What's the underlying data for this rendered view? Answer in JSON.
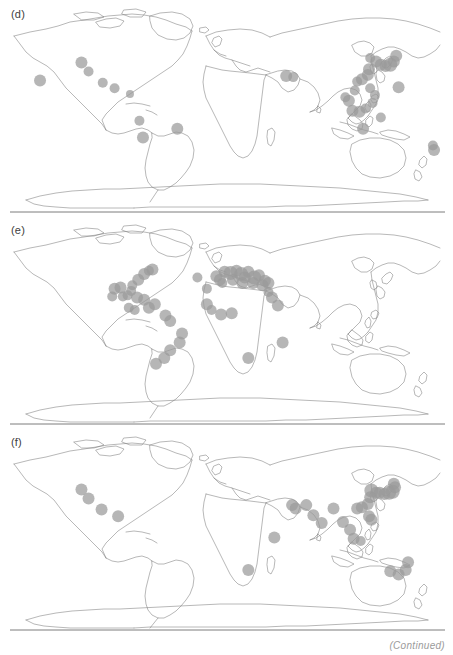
{
  "figure": {
    "caption": "(Continued)",
    "projection": "equirectangular",
    "marker_color": "#9a9a9a",
    "marker_opacity": 0.72,
    "coastline_color": "#7d7d7d",
    "background": "#ffffff",
    "lon_range": [
      -180,
      180
    ],
    "lat_range": [
      -90,
      90
    ]
  },
  "panels": [
    {
      "id": "panel-d",
      "label": "(d)",
      "region_summary": "Indo-West Pacific and eastern Pacific",
      "chart_data": {
        "type": "scatter",
        "title": "(d)",
        "xlabel": "Longitude",
        "ylabel": "Latitude",
        "xlim": [
          -180,
          180
        ],
        "ylim": [
          -90,
          90
        ],
        "grid": false,
        "legend": null,
        "series": [
          {
            "name": "occurrence records",
            "marker": "filled-circle",
            "color": "#9a9a9a",
            "points": [
              {
                "lon": -123,
                "lat": 37,
                "r": 6
              },
              {
                "lon": -117,
                "lat": 29,
                "r": 5
              },
              {
                "lon": -105,
                "lat": 19,
                "r": 5
              },
              {
                "lon": -95,
                "lat": 14,
                "r": 5
              },
              {
                "lon": -82,
                "lat": 9,
                "r": 4
              },
              {
                "lon": -74,
                "lat": -15,
                "r": 5
              },
              {
                "lon": -71,
                "lat": -30,
                "r": 6
              },
              {
                "lon": -42,
                "lat": -22,
                "r": 6
              },
              {
                "lon": -158,
                "lat": 21,
                "r": 6
              },
              {
                "lon": 50,
                "lat": 25,
                "r": 6
              },
              {
                "lon": 56,
                "lat": 24,
                "r": 5
              },
              {
                "lon": 121,
                "lat": 41,
                "r": 5
              },
              {
                "lon": 126,
                "lat": 38,
                "r": 6
              },
              {
                "lon": 130,
                "lat": 35,
                "r": 6
              },
              {
                "lon": 134,
                "lat": 34,
                "r": 6
              },
              {
                "lon": 138,
                "lat": 35,
                "r": 7
              },
              {
                "lon": 141,
                "lat": 38,
                "r": 6
              },
              {
                "lon": 143,
                "lat": 43,
                "r": 6
              },
              {
                "lon": 120,
                "lat": 31,
                "r": 6
              },
              {
                "lon": 119,
                "lat": 26,
                "r": 6
              },
              {
                "lon": 114,
                "lat": 22,
                "r": 6
              },
              {
                "lon": 110,
                "lat": 20,
                "r": 5
              },
              {
                "lon": 108,
                "lat": 12,
                "r": 5
              },
              {
                "lon": 103,
                "lat": 3,
                "r": 6
              },
              {
                "lon": 100,
                "lat": 6,
                "r": 5
              },
              {
                "lon": 106,
                "lat": -6,
                "r": 6
              },
              {
                "lon": 112,
                "lat": -7,
                "r": 6
              },
              {
                "lon": 117,
                "lat": -4,
                "r": 5
              },
              {
                "lon": 123,
                "lat": 1,
                "r": 5
              },
              {
                "lon": 121,
                "lat": 14,
                "r": 5
              },
              {
                "lon": 125,
                "lat": 8,
                "r": 5
              },
              {
                "lon": 145,
                "lat": 15,
                "r": 6
              },
              {
                "lon": 130,
                "lat": -12,
                "r": 5
              },
              {
                "lon": 115,
                "lat": -22,
                "r": 6
              },
              {
                "lon": 174,
                "lat": -37,
                "r": 5
              },
              {
                "lon": 175,
                "lat": -41,
                "r": 6
              }
            ]
          }
        ]
      }
    },
    {
      "id": "panel-e",
      "label": "(e)",
      "region_summary": "Atlantic Ocean, Mediterranean Sea and Caribbean",
      "chart_data": {
        "type": "scatter",
        "title": "(e)",
        "xlabel": "Longitude",
        "ylabel": "Latitude",
        "xlim": [
          -180,
          180
        ],
        "ylim": [
          -90,
          90
        ],
        "grid": false,
        "legend": null,
        "series": [
          {
            "name": "occurrence records",
            "marker": "filled-circle",
            "color": "#9a9a9a",
            "points": [
              {
                "lon": -63,
                "lat": 45,
                "r": 6
              },
              {
                "lon": -66,
                "lat": 44,
                "r": 5
              },
              {
                "lon": -70,
                "lat": 41,
                "r": 6
              },
              {
                "lon": -75,
                "lat": 36,
                "r": 6
              },
              {
                "lon": -80,
                "lat": 31,
                "r": 5
              },
              {
                "lon": -81,
                "lat": 26,
                "r": 5
              },
              {
                "lon": -90,
                "lat": 29,
                "r": 6
              },
              {
                "lon": -95,
                "lat": 28,
                "r": 6
              },
              {
                "lon": -97,
                "lat": 21,
                "r": 5
              },
              {
                "lon": -88,
                "lat": 21,
                "r": 5
              },
              {
                "lon": -84,
                "lat": 22,
                "r": 5
              },
              {
                "lon": -76,
                "lat": 20,
                "r": 6
              },
              {
                "lon": -70,
                "lat": 18,
                "r": 6
              },
              {
                "lon": -66,
                "lat": 11,
                "r": 6
              },
              {
                "lon": -61,
                "lat": 14,
                "r": 6
              },
              {
                "lon": -78,
                "lat": 9,
                "r": 5
              },
              {
                "lon": -83,
                "lat": 11,
                "r": 5
              },
              {
                "lon": -52,
                "lat": 4,
                "r": 6
              },
              {
                "lon": -48,
                "lat": -1,
                "r": 6
              },
              {
                "lon": -38,
                "lat": -12,
                "r": 6
              },
              {
                "lon": -40,
                "lat": -20,
                "r": 6
              },
              {
                "lon": -48,
                "lat": -27,
                "r": 6
              },
              {
                "lon": -53,
                "lat": -34,
                "r": 6
              },
              {
                "lon": -60,
                "lat": -39,
                "r": 6
              },
              {
                "lon": -25,
                "lat": 38,
                "r": 5
              },
              {
                "lon": -17,
                "lat": 28,
                "r": 5
              },
              {
                "lon": -9,
                "lat": 39,
                "r": 6
              },
              {
                "lon": -6,
                "lat": 36,
                "r": 6
              },
              {
                "lon": -2,
                "lat": 43,
                "r": 6
              },
              {
                "lon": 3,
                "lat": 42,
                "r": 7
              },
              {
                "lon": 8,
                "lat": 44,
                "r": 6
              },
              {
                "lon": 12,
                "lat": 41,
                "r": 7
              },
              {
                "lon": 15,
                "lat": 38,
                "r": 6
              },
              {
                "lon": 18,
                "lat": 43,
                "r": 6
              },
              {
                "lon": 23,
                "lat": 38,
                "r": 7
              },
              {
                "lon": 27,
                "lat": 40,
                "r": 6
              },
              {
                "lon": 32,
                "lat": 35,
                "r": 6
              },
              {
                "lon": 35,
                "lat": 33,
                "r": 6
              },
              {
                "lon": 30,
                "lat": 31,
                "r": 6
              },
              {
                "lon": 22,
                "lat": 33,
                "r": 6
              },
              {
                "lon": 13,
                "lat": 33,
                "r": 6
              },
              {
                "lon": 5,
                "lat": 36,
                "r": 6
              },
              {
                "lon": -4,
                "lat": 33,
                "r": 5
              },
              {
                "lon": 35,
                "lat": 25,
                "r": 5
              },
              {
                "lon": 38,
                "lat": 20,
                "r": 6
              },
              {
                "lon": 43,
                "lat": 13,
                "r": 6
              },
              {
                "lon": -17,
                "lat": 14,
                "r": 6
              },
              {
                "lon": -13,
                "lat": 9,
                "r": 5
              },
              {
                "lon": -5,
                "lat": 5,
                "r": 6
              },
              {
                "lon": 4,
                "lat": 6,
                "r": 6
              },
              {
                "lon": 18,
                "lat": -34,
                "r": 6
              },
              {
                "lon": 47,
                "lat": -20,
                "r": 6
              }
            ]
          }
        ]
      }
    },
    {
      "id": "panel-f",
      "label": "(f)",
      "region_summary": "Indo-Pacific, northern Indian Ocean and eastern Pacific",
      "chart_data": {
        "type": "scatter",
        "title": "(f)",
        "xlabel": "Longitude",
        "ylabel": "Latitude",
        "xlim": [
          -180,
          180
        ],
        "ylim": [
          -90,
          90
        ],
        "grid": false,
        "legend": null,
        "series": [
          {
            "name": "occurrence records",
            "marker": "filled-circle",
            "color": "#9a9a9a",
            "points": [
              {
                "lon": -123,
                "lat": 38,
                "r": 6
              },
              {
                "lon": -117,
                "lat": 30,
                "r": 6
              },
              {
                "lon": -106,
                "lat": 20,
                "r": 6
              },
              {
                "lon": -92,
                "lat": 14,
                "r": 6
              },
              {
                "lon": 18,
                "lat": -34,
                "r": 6
              },
              {
                "lon": 40,
                "lat": -5,
                "r": 6
              },
              {
                "lon": 55,
                "lat": 24,
                "r": 6
              },
              {
                "lon": 58,
                "lat": 21,
                "r": 6
              },
              {
                "lon": 67,
                "lat": 24,
                "r": 6
              },
              {
                "lon": 73,
                "lat": 15,
                "r": 6
              },
              {
                "lon": 80,
                "lat": 8,
                "r": 6
              },
              {
                "lon": 90,
                "lat": 21,
                "r": 6
              },
              {
                "lon": 98,
                "lat": 9,
                "r": 6
              },
              {
                "lon": 104,
                "lat": 2,
                "r": 6
              },
              {
                "lon": 107,
                "lat": -6,
                "r": 6
              },
              {
                "lon": 113,
                "lat": -8,
                "r": 5
              },
              {
                "lon": 120,
                "lat": 14,
                "r": 6
              },
              {
                "lon": 122,
                "lat": 11,
                "r": 6
              },
              {
                "lon": 110,
                "lat": 21,
                "r": 6
              },
              {
                "lon": 114,
                "lat": 22,
                "r": 6
              },
              {
                "lon": 119,
                "lat": 25,
                "r": 6
              },
              {
                "lon": 121,
                "lat": 31,
                "r": 6
              },
              {
                "lon": 122,
                "lat": 37,
                "r": 7
              },
              {
                "lon": 126,
                "lat": 35,
                "r": 6
              },
              {
                "lon": 129,
                "lat": 35,
                "r": 6
              },
              {
                "lon": 133,
                "lat": 34,
                "r": 6
              },
              {
                "lon": 137,
                "lat": 35,
                "r": 7
              },
              {
                "lon": 140,
                "lat": 36,
                "r": 7
              },
              {
                "lon": 142,
                "lat": 40,
                "r": 6
              },
              {
                "lon": 141,
                "lat": 43,
                "r": 6
              },
              {
                "lon": 153,
                "lat": -27,
                "r": 6
              },
              {
                "lon": 151,
                "lat": -34,
                "r": 6
              },
              {
                "lon": 145,
                "lat": -38,
                "r": 6
              },
              {
                "lon": 138,
                "lat": -35,
                "r": 6
              }
            ]
          }
        ]
      }
    }
  ]
}
